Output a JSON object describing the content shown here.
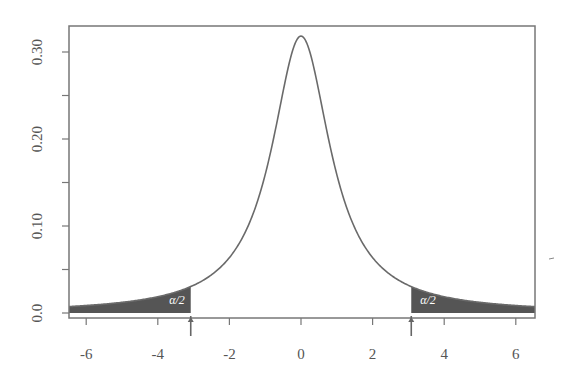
{
  "chart_data": {
    "type": "area",
    "title": "",
    "xlabel": "",
    "ylabel": "",
    "distribution": "Cauchy (standard) density",
    "xlim": [
      -6.5,
      6.5
    ],
    "ylim": [
      0.0,
      0.33
    ],
    "x_ticks": [
      -6,
      -4,
      -2,
      0,
      2,
      4,
      6
    ],
    "x_tick_labels": [
      "-6",
      "-4",
      "-2",
      "0",
      "2",
      "4",
      "6"
    ],
    "y_ticks": [
      0.0,
      0.05,
      0.1,
      0.15,
      0.2,
      0.25,
      0.3
    ],
    "y_tick_labels": [
      "0.0",
      "",
      "0.10",
      "",
      "0.20",
      "",
      "0.30"
    ],
    "peak": {
      "x": 0,
      "y": 0.318
    },
    "critical_values": [
      -3.08,
      3.08
    ],
    "shaded_regions": [
      {
        "from": -6.5,
        "to": -3.08,
        "label": "α/2"
      },
      {
        "from": 3.08,
        "to": 6.5,
        "label": "α/2"
      }
    ],
    "curve_points": {
      "x": [
        -6.5,
        -6,
        -5,
        -4,
        -3.08,
        -3,
        -2,
        -1.5,
        -1,
        -0.5,
        0,
        0.5,
        1,
        1.5,
        2,
        3,
        3.08,
        4,
        5,
        6,
        6.5
      ],
      "y": [
        0.0074,
        0.0086,
        0.0122,
        0.0187,
        0.0304,
        0.0318,
        0.0637,
        0.0979,
        0.1592,
        0.2546,
        0.3183,
        0.2546,
        0.1592,
        0.0979,
        0.0637,
        0.0318,
        0.0304,
        0.0187,
        0.0122,
        0.0086,
        0.0074
      ]
    },
    "grid": false,
    "legend": null
  },
  "labels": {
    "left_tail": "α/2",
    "right_tail": "α/2"
  },
  "colors": {
    "curve": "#6a6a6a",
    "shade": "#555555",
    "axis": "#777777",
    "text": "#555555"
  }
}
